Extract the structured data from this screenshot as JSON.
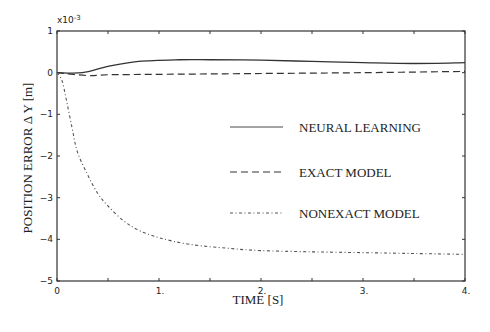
{
  "chart_data": {
    "type": "line",
    "title": "",
    "xlabel": "TIME [S]",
    "ylabel": "POSITION ERROR  Δ Y  [m]",
    "y_multiplier": "x10",
    "y_multiplier_exp": "-3",
    "xlim": [
      0,
      4
    ],
    "ylim": [
      -5,
      1
    ],
    "x_ticks": [
      0,
      0.5,
      1,
      1.5,
      2,
      2.5,
      3,
      3.5,
      4
    ],
    "x_tick_labels": [
      "0",
      "1.",
      "2.",
      "3.",
      "4."
    ],
    "y_ticks": [
      1,
      0,
      -1,
      -2,
      -3,
      -4,
      -5
    ],
    "y_tick_labels": [
      "1",
      "0",
      "−1",
      "−2",
      "−3",
      "−4",
      "−5"
    ],
    "grid": false,
    "legend_position": "inside-center-right",
    "series": [
      {
        "name": "NEURAL LEARNING",
        "style": "solid",
        "x": [
          0,
          0.25,
          0.5,
          0.8,
          1.2,
          1.5,
          2.0,
          2.5,
          3.0,
          3.5,
          4.0
        ],
        "values": [
          0,
          0,
          0.15,
          0.27,
          0.31,
          0.31,
          0.3,
          0.27,
          0.24,
          0.22,
          0.24
        ]
      },
      {
        "name": "EXACT MODEL",
        "style": "dashed",
        "x": [
          0,
          0.3,
          0.5,
          1.0,
          2.0,
          3.0,
          4.0
        ],
        "values": [
          0,
          -0.07,
          -0.05,
          -0.04,
          -0.02,
          0.0,
          0.03
        ]
      },
      {
        "name": "NONEXACT MODEL",
        "style": "dash-dot",
        "x": [
          0,
          0.05,
          0.1,
          0.15,
          0.2,
          0.3,
          0.4,
          0.5,
          0.65,
          0.8,
          1.0,
          1.3,
          1.7,
          2.0,
          2.5,
          3.0,
          3.5,
          4.0
        ],
        "values": [
          0,
          -0.2,
          -0.75,
          -1.35,
          -1.9,
          -2.45,
          -2.9,
          -3.2,
          -3.55,
          -3.78,
          -3.96,
          -4.12,
          -4.22,
          -4.27,
          -4.3,
          -4.32,
          -4.34,
          -4.36
        ]
      }
    ]
  }
}
